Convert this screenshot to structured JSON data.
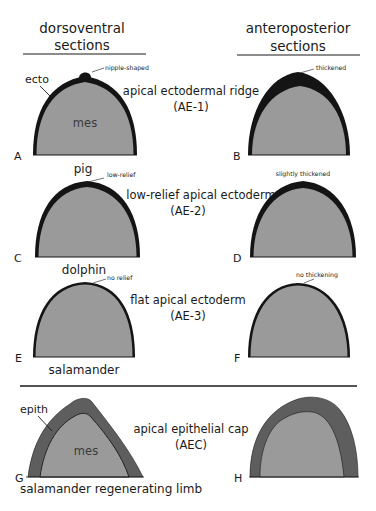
{
  "headers": {
    "left": [
      "dorsoventral",
      "sections"
    ],
    "right": [
      "anteroposterior",
      "sections"
    ]
  },
  "rows": [
    {
      "category": "apical ectodermal ridge",
      "code": "(AE-1)",
      "left": {
        "panel": "A",
        "annotation": "nipple-shaped",
        "species": "pig",
        "tissue_outer": "ecto",
        "tissue_inner": "mes"
      },
      "right": {
        "panel": "B",
        "annotation": "thickened"
      }
    },
    {
      "category": "low-relief apical ectoderm",
      "code": "(AE-2)",
      "left": {
        "panel": "C",
        "annotation": "low-relief",
        "species": "dolphin"
      },
      "right": {
        "panel": "D",
        "annotation": "slightly thickened"
      }
    },
    {
      "category": "flat apical ectoderm",
      "code": "(AE-3)",
      "left": {
        "panel": "E",
        "annotation": "no relief",
        "species": "salamander"
      },
      "right": {
        "panel": "F",
        "annotation": "no thickening"
      }
    },
    {
      "category": "apical epithelial cap",
      "code": "(AEC)",
      "left": {
        "panel": "G",
        "species": "salamander regenerating limb",
        "tissue_outer": "epith",
        "tissue_inner": "mes"
      },
      "right": {
        "panel": "H"
      }
    }
  ],
  "colors": {
    "ectoderm": "#141414",
    "mesenchyme": "#9a9a9a",
    "epithelium": "#5e5e5e",
    "background": "#ffffff"
  }
}
